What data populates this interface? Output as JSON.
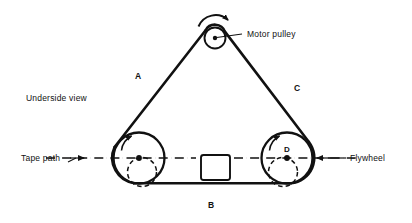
{
  "figure": {
    "title_text": "Underside view",
    "background": "#ffffff",
    "ink_color": "#111111"
  },
  "labels": {
    "underside_view": "Underside view",
    "tape_path": "Tape path",
    "motor_pulley": "Motor pulley",
    "flywheel": "Flywheel",
    "belt_a": "A",
    "belt_b": "B",
    "belt_c": "C",
    "node_d": "D"
  },
  "components": [
    {
      "id": "motor-pulley",
      "name": "Motor pulley",
      "shape": "circle",
      "cx": 215,
      "cy": 38,
      "r": 10.5,
      "rotation": "counterclockwise",
      "has_center_dot": true
    },
    {
      "id": "left-pulley",
      "name": "Left pulley",
      "shape": "circle",
      "cx": 139,
      "cy": 158,
      "r": 25.5,
      "rotation": "clockwise",
      "has_center_dot": true,
      "inner_dashed_circle": {
        "cx": 142,
        "cy": 172,
        "r": 14.5
      }
    },
    {
      "id": "flywheel",
      "name": "Flywheel",
      "shape": "circle",
      "cx": 287,
      "cy": 158,
      "r": 25.5,
      "rotation": "clockwise",
      "has_center_dot": true,
      "label": "D",
      "inner_dashed_circle": {
        "cx": 283,
        "cy": 172,
        "r": 14.5
      }
    },
    {
      "id": "capstan-block",
      "name": "Capstan block",
      "shape": "rounded-rect",
      "x": 201,
      "y": 155,
      "width": 29,
      "height": 25
    }
  ],
  "belt_segments": [
    {
      "id": "A",
      "label": "A",
      "from": "left-pulley",
      "to": "motor-pulley",
      "label_x": 138,
      "label_y": 79
    },
    {
      "id": "B",
      "label": "B",
      "from": "left-pulley",
      "to": "flywheel",
      "label_x": 211,
      "label_y": 205
    },
    {
      "id": "C",
      "label": "C",
      "from": "motor-pulley",
      "to": "flywheel",
      "label_x": 296,
      "label_y": 91
    }
  ],
  "tape_path": {
    "label": "Tape path",
    "y": 158,
    "x_start": 45,
    "x_end": 355,
    "arrow_left_x": 80,
    "arrow_right_x": 320
  },
  "callouts": [
    {
      "id": "motor-pulley-callout",
      "text": "Motor pulley",
      "text_x": 246,
      "text_y": 38,
      "leader_from_x": 222,
      "leader_from_y": 36,
      "leader_to_x": 241,
      "leader_to_y": 36
    },
    {
      "id": "flywheel-callout",
      "text": "Flywheel",
      "text_x": 349,
      "text_y": 161,
      "leader_from_x": 327,
      "leader_from_y": 158,
      "leader_to_x": 345,
      "leader_to_y": 158
    },
    {
      "id": "tape-path-callout",
      "text": "Tape path",
      "text_x": 22,
      "text_y": 161
    }
  ]
}
